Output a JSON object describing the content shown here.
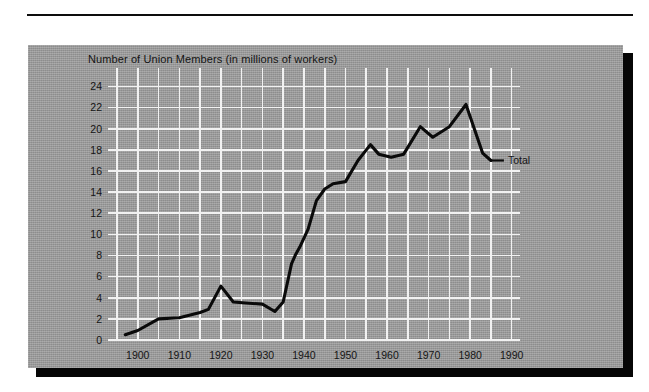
{
  "figure": {
    "panel_color": "#9e9e9e",
    "gridline_color": "#f2f2f2",
    "line_color": "#0a0a0a",
    "title": "Number of Union Members (in millions of workers)"
  },
  "chart_data": {
    "type": "line",
    "title": "Number of Union Members (in millions of workers)",
    "xlabel": "",
    "ylabel": "Number of Union Members (in millions of workers)",
    "xlim": [
      1895,
      1992
    ],
    "ylim": [
      0,
      25
    ],
    "grid": true,
    "grid_x_step": 5,
    "grid_y_step": 2,
    "legend_position": "inline-right",
    "x_tick_labels": [
      "1900",
      "1910",
      "1920",
      "1930",
      "1940",
      "1950",
      "1960",
      "1970",
      "1980",
      "1990"
    ],
    "x_ticks": [
      1900,
      1910,
      1920,
      1930,
      1940,
      1950,
      1960,
      1970,
      1980,
      1990
    ],
    "y_tick_labels": [
      "0",
      "2",
      "4",
      "6",
      "8",
      "10",
      "12",
      "14",
      "16",
      "18",
      "20",
      "22",
      "24"
    ],
    "y_ticks": [
      0,
      2,
      4,
      6,
      8,
      10,
      12,
      14,
      16,
      18,
      20,
      22,
      24
    ],
    "series": [
      {
        "name": "Total",
        "label": "Total",
        "color": "#0a0a0a",
        "points": [
          [
            1897,
            0.5
          ],
          [
            1900,
            0.9
          ],
          [
            1905,
            2.0
          ],
          [
            1910,
            2.1
          ],
          [
            1915,
            2.6
          ],
          [
            1917,
            2.9
          ],
          [
            1920,
            5.1
          ],
          [
            1923,
            3.6
          ],
          [
            1926,
            3.5
          ],
          [
            1930,
            3.4
          ],
          [
            1933,
            2.7
          ],
          [
            1935,
            3.6
          ],
          [
            1937,
            7.2
          ],
          [
            1938,
            8.1
          ],
          [
            1939,
            8.8
          ],
          [
            1941,
            10.5
          ],
          [
            1943,
            13.2
          ],
          [
            1945,
            14.3
          ],
          [
            1947,
            14.8
          ],
          [
            1950,
            15.0
          ],
          [
            1953,
            17.0
          ],
          [
            1956,
            18.5
          ],
          [
            1958,
            17.6
          ],
          [
            1961,
            17.3
          ],
          [
            1964,
            17.6
          ],
          [
            1968,
            20.2
          ],
          [
            1971,
            19.2
          ],
          [
            1975,
            20.2
          ],
          [
            1979,
            22.3
          ],
          [
            1983,
            17.7
          ],
          [
            1985,
            17.0
          ]
        ]
      }
    ]
  }
}
